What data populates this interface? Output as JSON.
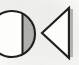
{
  "image": {
    "title": "Geometric glyph pair",
    "description": "Two hand-drawn geometric symbols on scanned off-white paper",
    "width": 79,
    "height": 65,
    "background_color": "#fbfbfa",
    "ink_color": "#201f1d",
    "shade_color": "#a9a8a4",
    "shade_color_light": "#c9c8c4"
  },
  "glyphs": [
    {
      "id": "circle-with-chord",
      "name": "circle-glyph",
      "shape": "circle",
      "label": "Circle with vertical chord and shaded lune",
      "center_x": 12,
      "center_y": 34,
      "radius": 23,
      "stroke_width": 2.1,
      "stroke_color": "#201f1d",
      "fill_color": "#fdfdfc",
      "chord": {
        "name": "chord-line",
        "x": 22.5,
        "y_top": 13.8,
        "y_bottom": 54.2,
        "stroke_width": 2.0,
        "stroke_color": "#201f1d"
      },
      "lune": {
        "name": "lune-shading",
        "fill_color": "#b0afab",
        "label": "Shaded crescent between chord and right arc"
      },
      "clipped_edge": "left"
    },
    {
      "id": "left-pointing-triangle",
      "name": "triangle-glyph",
      "shape": "triangle",
      "label": "Left-pointing triangle with vertical right edge",
      "apex_x": 42,
      "apex_y": 33,
      "top_x": 69,
      "top_y": 8,
      "bottom_x": 69,
      "bottom_y": 58,
      "stroke_width": 2.1,
      "stroke_color": "#201f1d",
      "fill_color": "#fdfdfc",
      "edge_shadow": {
        "name": "edge-shadow",
        "x": 70.5,
        "y_top": 9,
        "y_bottom": 57,
        "width": 2.4,
        "fill_color": "#aeada9",
        "label": "Gray shadow band right of vertical edge"
      }
    }
  ]
}
